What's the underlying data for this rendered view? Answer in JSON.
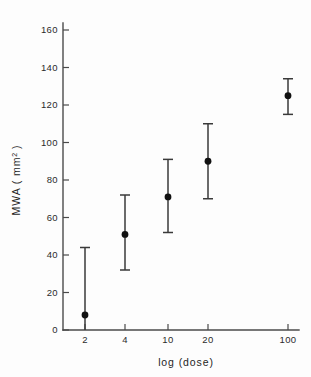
{
  "chart_data": {
    "type": "scatter",
    "title": "",
    "subtitle": "",
    "xlabel": "log (dose)",
    "ylabel": "MWA (mm2)",
    "ylabel_base": "MWA ( mm",
    "ylabel_sup": "2",
    "ylabel_close": " )",
    "xscale": "log",
    "grid": false,
    "legend": null,
    "x": [
      2,
      4,
      10,
      20,
      100
    ],
    "xticklabels": [
      "2",
      "4",
      "10",
      "20",
      "100"
    ],
    "yticks": [
      0,
      20,
      40,
      60,
      80,
      100,
      120,
      140,
      160
    ],
    "yticklabels": [
      "0",
      "20",
      "40",
      "60",
      "80",
      "100",
      "120",
      "140",
      "160"
    ],
    "ylim": [
      0,
      170
    ],
    "values": [
      8,
      51,
      71,
      90,
      125
    ],
    "error_upper": [
      44,
      72,
      91,
      110,
      134
    ],
    "error_lower": [
      0,
      32,
      52,
      70,
      115
    ],
    "series": [
      {
        "name": "MWA",
        "points": [
          {
            "x": 2,
            "xlabel": "2",
            "y": 8,
            "hi": 44,
            "lo": 0
          },
          {
            "x": 4,
            "xlabel": "4",
            "y": 51,
            "hi": 72,
            "lo": 32
          },
          {
            "x": 10,
            "xlabel": "10",
            "y": 71,
            "hi": 91,
            "lo": 52
          },
          {
            "x": 20,
            "xlabel": "20",
            "y": 90,
            "hi": 110,
            "lo": 70
          },
          {
            "x": 100,
            "xlabel": "100",
            "y": 125,
            "hi": 134,
            "lo": 115
          }
        ]
      }
    ],
    "marker": "filled-circle",
    "errorbar_style": "capped",
    "colors": {
      "marker": "#111111",
      "errorbar": "#3a3a3a",
      "axis": "#4a4a4a",
      "text": "#2b2b2b",
      "background": "#fdfdfd"
    }
  }
}
